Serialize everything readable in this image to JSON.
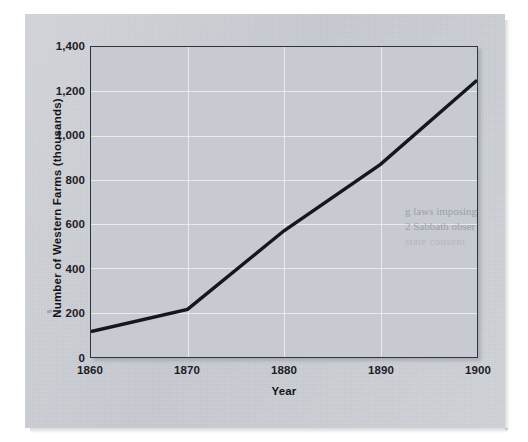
{
  "document": {
    "kind": "scanned-page-chart",
    "background_color": "#ffffff",
    "paper_color": "#c9ccd2"
  },
  "chart_data": {
    "type": "line",
    "title": "",
    "xlabel": "Year",
    "ylabel": "Number of Western Farms (thousands)",
    "x": [
      1860,
      1870,
      1880,
      1890,
      1900
    ],
    "values": [
      115,
      215,
      570,
      870,
      1250
    ],
    "series": [
      {
        "name": "Number of Western Farms",
        "values": [
          115,
          215,
          570,
          870,
          1250
        ],
        "color": "#14181e"
      }
    ],
    "xlim": [
      1860,
      1900
    ],
    "ylim": [
      0,
      1400
    ],
    "xticks": [
      1860,
      1870,
      1880,
      1890,
      1900
    ],
    "xtick_labels": [
      "1860",
      "1870",
      "1880",
      "1890",
      "1900"
    ],
    "yticks": [
      0,
      200,
      400,
      600,
      800,
      1000,
      1200,
      1400
    ],
    "ytick_labels": [
      "0",
      "200",
      "400",
      "600",
      "800",
      "1,000",
      "1,200",
      "1,400"
    ],
    "grid": true,
    "grid_color": "#ffffff",
    "legend": false,
    "plot_background": "#c7cad1",
    "frame_color": "#2e333c"
  },
  "axes": {
    "y_title": "Number of Western Farms (thousands)",
    "x_title": "Year",
    "y_labels": [
      "1,400",
      "1,200",
      "1,000",
      "800",
      "600",
      "400",
      "200",
      "0"
    ],
    "x_labels": [
      "1860",
      "1870",
      "1880",
      "1890",
      "1900"
    ]
  },
  "bleed_through_text": {
    "line1": "g laws imposing",
    "line2": "2 Sabbath obser",
    "line3": "state consent"
  }
}
